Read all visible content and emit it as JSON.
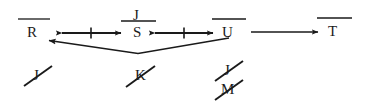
{
  "diagram": {
    "ink_color": "#1a1a1a",
    "background_color": "#ffffff",
    "top_row": {
      "nodes": [
        {
          "id": "node-r",
          "label": "R",
          "overline": true,
          "x": 33,
          "y": 32
        },
        {
          "id": "node-s",
          "label": "S",
          "overline": true,
          "x": 138,
          "y": 32
        },
        {
          "id": "node-u",
          "label": "U",
          "overline": true,
          "x": 228,
          "y": 32
        },
        {
          "id": "node-t",
          "label": "T",
          "overline": true,
          "x": 333,
          "y": 32
        }
      ],
      "superscripts": [
        {
          "id": "sup-j",
          "label": "J",
          "over": "node-s",
          "x": 138,
          "y": 15
        }
      ]
    },
    "connectors": [
      {
        "id": "arrow-r-s",
        "from": "R",
        "to": "S",
        "style": "double-headed",
        "tick": true
      },
      {
        "id": "arrow-s-u",
        "from": "S",
        "to": "U",
        "style": "double-headed",
        "tick": true
      },
      {
        "id": "arrow-u-t",
        "from": "U",
        "to": "T",
        "style": "single-headed",
        "tick": false
      },
      {
        "id": "arrow-u-r-feedback",
        "from": "U",
        "to": "R",
        "style": "v-shaped-single-headed",
        "tick": false
      }
    ],
    "struck_items": [
      {
        "id": "struck-j-left",
        "label": "J",
        "x": 37,
        "y": 73
      },
      {
        "id": "struck-k",
        "label": "K",
        "x": 140,
        "y": 73
      },
      {
        "id": "struck-j-right",
        "label": "J",
        "x": 228,
        "y": 69
      },
      {
        "id": "struck-m",
        "label": "M",
        "x": 228,
        "y": 88
      }
    ]
  }
}
